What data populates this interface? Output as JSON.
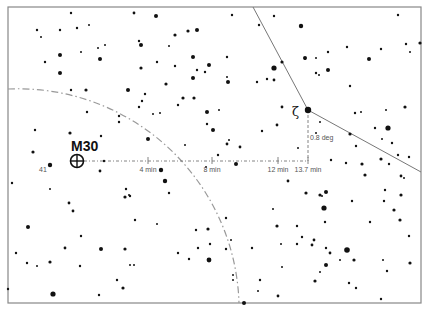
{
  "chart": {
    "frame": {
      "x": 8,
      "y": 7,
      "w": 413,
      "h": 296,
      "color": "#888888"
    },
    "target": {
      "label": "M30",
      "x": 77,
      "y": 161,
      "r": 6.5,
      "label_x": 71,
      "label_y": 151
    },
    "guide_star": {
      "label": "ζ",
      "x": 308,
      "y": 110,
      "glyph_x": 292,
      "glyph_y": 116
    },
    "star_label_41": {
      "label": "41",
      "x": 39,
      "y": 172
    },
    "horizontal_line": {
      "x1": 84,
      "x2": 308,
      "y": 161
    },
    "vertical_line": {
      "x": 308,
      "y1": 115,
      "y2": 161
    },
    "ticks": [
      {
        "x": 148,
        "label": "4 min"
      },
      {
        "x": 212,
        "label": "8 min"
      },
      {
        "x": 278,
        "label": "12 min"
      },
      {
        "x": 308,
        "label": "13.7 min"
      }
    ],
    "vertical_label": "0.8 deg",
    "boundary_line": [
      [
        253,
        7
      ],
      [
        308,
        110
      ],
      [
        421,
        172
      ]
    ],
    "dashed_arc": {
      "cx": 20,
      "cy": 310,
      "r": 221,
      "start": [
        8,
        89
      ],
      "end": [
        239,
        303
      ]
    },
    "stars": [
      [
        71,
        13,
        1.2
      ],
      [
        134,
        13,
        1.4
      ],
      [
        156,
        16,
        2
      ],
      [
        232,
        15,
        1.2
      ],
      [
        37,
        30,
        1.2
      ],
      [
        60,
        30,
        1.2
      ],
      [
        77,
        28,
        1.2
      ],
      [
        89,
        25,
        1
      ],
      [
        41,
        37,
        1
      ],
      [
        175,
        35,
        1.6
      ],
      [
        188,
        31,
        1.6
      ],
      [
        197,
        30,
        2
      ],
      [
        139,
        41,
        1.2
      ],
      [
        141,
        45,
        2
      ],
      [
        169,
        46,
        1
      ],
      [
        105,
        45,
        1
      ],
      [
        98,
        48,
        1
      ],
      [
        81,
        52,
        1
      ],
      [
        60,
        55,
        2
      ],
      [
        45,
        62,
        1.2
      ],
      [
        100,
        59,
        2
      ],
      [
        193,
        57,
        2
      ],
      [
        157,
        62,
        1.2
      ],
      [
        141,
        68,
        1.6
      ],
      [
        175,
        66,
        1.2
      ],
      [
        209,
        65,
        2
      ],
      [
        197,
        70,
        1.2
      ],
      [
        205,
        72,
        1.2
      ],
      [
        60,
        73,
        2
      ],
      [
        193,
        78,
        2
      ],
      [
        227,
        57,
        1.2
      ],
      [
        227,
        77,
        1
      ],
      [
        228,
        82,
        2
      ],
      [
        166,
        84,
        1.6
      ],
      [
        71,
        90,
        1.2
      ],
      [
        86,
        90,
        1.6
      ],
      [
        128,
        90,
        2
      ],
      [
        145,
        94,
        1.2
      ],
      [
        142,
        101,
        1.2
      ],
      [
        139,
        107,
        1.2
      ],
      [
        183,
        98,
        1.6
      ],
      [
        194,
        98,
        1.6
      ],
      [
        178,
        105,
        1.2
      ],
      [
        207,
        112,
        2
      ],
      [
        153,
        114,
        1
      ],
      [
        160,
        113,
        1
      ],
      [
        87,
        112,
        1.2
      ],
      [
        119,
        116,
        1.2
      ],
      [
        119,
        122,
        1.2
      ],
      [
        207,
        124,
        1.2
      ],
      [
        213,
        130,
        2
      ],
      [
        219,
        110,
        1
      ],
      [
        148,
        139,
        2
      ],
      [
        227,
        144,
        1.4
      ],
      [
        229,
        140,
        1
      ],
      [
        240,
        147,
        1.4
      ],
      [
        185,
        145,
        1
      ],
      [
        35,
        130,
        1.2
      ],
      [
        70,
        133,
        1.6
      ],
      [
        101,
        136,
        1.2
      ],
      [
        33,
        152,
        1.6
      ],
      [
        50,
        165,
        2.2
      ],
      [
        218,
        155,
        1.2
      ],
      [
        236,
        164,
        2
      ],
      [
        206,
        167,
        1
      ],
      [
        161,
        170,
        2.2
      ],
      [
        100,
        171,
        1.4
      ],
      [
        104,
        161,
        1.2
      ],
      [
        274,
        16,
        1.2
      ],
      [
        301,
        26,
        2.2
      ],
      [
        259,
        25,
        1.2
      ],
      [
        282,
        62,
        1.6
      ],
      [
        274,
        68,
        2.6
      ],
      [
        267,
        79,
        1.2
      ],
      [
        274,
        80,
        1.4
      ],
      [
        257,
        82,
        1.2
      ],
      [
        305,
        58,
        2
      ],
      [
        305,
        59,
        1
      ],
      [
        328,
        52,
        1.2
      ],
      [
        347,
        47,
        1.2
      ],
      [
        316,
        58,
        1
      ],
      [
        328,
        70,
        2
      ],
      [
        316,
        73,
        1.2
      ],
      [
        319,
        75,
        1
      ],
      [
        350,
        86,
        1.2
      ],
      [
        369,
        59,
        2
      ],
      [
        398,
        15,
        1.2
      ],
      [
        406,
        44,
        1.2
      ],
      [
        410,
        52,
        1
      ],
      [
        420,
        43,
        1.6
      ],
      [
        381,
        49,
        1.2
      ],
      [
        405,
        107,
        1.6
      ],
      [
        388,
        128,
        2.6
      ],
      [
        355,
        113,
        1.2
      ],
      [
        361,
        112,
        1
      ],
      [
        375,
        128,
        1.2
      ],
      [
        386,
        110,
        1
      ],
      [
        282,
        107,
        1.4
      ],
      [
        277,
        125,
        1.4
      ],
      [
        320,
        122,
        1
      ],
      [
        262,
        131,
        1.2
      ],
      [
        350,
        134,
        1.6
      ],
      [
        316,
        133,
        1
      ],
      [
        298,
        148,
        1
      ],
      [
        392,
        143,
        1.2
      ],
      [
        382,
        139,
        1
      ],
      [
        320,
        195,
        1.6
      ],
      [
        322,
        196,
        1
      ],
      [
        331,
        160,
        1.2
      ],
      [
        346,
        163,
        1.2
      ],
      [
        356,
        146,
        1.2
      ],
      [
        362,
        164,
        1.6
      ],
      [
        365,
        175,
        1.6
      ],
      [
        381,
        159,
        1.6
      ],
      [
        389,
        164,
        1.2
      ],
      [
        398,
        155,
        1.2
      ],
      [
        409,
        157,
        1.2
      ],
      [
        401,
        176,
        1.4
      ],
      [
        404,
        178,
        1
      ],
      [
        394,
        210,
        1.6
      ],
      [
        385,
        190,
        1.2
      ],
      [
        384,
        201,
        1.2
      ],
      [
        288,
        181,
        1.4
      ],
      [
        306,
        193,
        1.6
      ],
      [
        352,
        201,
        1.2
      ],
      [
        273,
        209,
        1
      ],
      [
        277,
        226,
        1.6
      ],
      [
        297,
        226,
        1.2
      ],
      [
        326,
        192,
        2
      ],
      [
        324,
        208,
        2.6
      ],
      [
        325,
        222,
        1.2
      ],
      [
        370,
        222,
        1.2
      ],
      [
        401,
        195,
        1.6
      ],
      [
        394,
        210,
        1
      ],
      [
        312,
        245,
        1.4
      ],
      [
        326,
        248,
        1.2
      ],
      [
        326,
        265,
        2
      ],
      [
        354,
        260,
        1.6
      ],
      [
        320,
        272,
        1
      ],
      [
        347,
        250,
        2.8
      ],
      [
        330,
        253,
        1.4
      ],
      [
        340,
        260,
        1
      ],
      [
        302,
        237,
        1.2
      ],
      [
        314,
        240,
        1.4
      ],
      [
        356,
        288,
        1.2
      ],
      [
        381,
        299,
        1.2
      ],
      [
        258,
        291,
        1
      ],
      [
        260,
        280,
        1.2
      ],
      [
        278,
        296,
        1.4
      ],
      [
        349,
        283,
        1.2
      ],
      [
        315,
        281,
        1.6
      ],
      [
        297,
        244,
        1.2
      ],
      [
        409,
        236,
        1.2
      ],
      [
        400,
        220,
        1.6
      ],
      [
        410,
        263,
        1.6
      ],
      [
        281,
        244,
        1
      ],
      [
        282,
        267,
        1
      ],
      [
        387,
        271,
        1.2
      ],
      [
        383,
        260,
        1
      ],
      [
        244,
        303,
        2
      ],
      [
        233,
        280,
        1
      ],
      [
        252,
        248,
        1.2
      ],
      [
        233,
        275,
        1
      ],
      [
        12,
        183,
        1.2
      ],
      [
        50,
        189,
        1
      ],
      [
        69,
        203,
        1.4
      ],
      [
        73,
        211,
        1.4
      ],
      [
        28,
        227,
        2
      ],
      [
        16,
        253,
        1.2
      ],
      [
        27,
        263,
        1.2
      ],
      [
        37,
        266,
        1
      ],
      [
        50,
        262,
        1.6
      ],
      [
        65,
        248,
        1.4
      ],
      [
        81,
        236,
        1.2
      ],
      [
        80,
        266,
        1.2
      ],
      [
        101,
        249,
        2
      ],
      [
        125,
        249,
        1.6
      ],
      [
        130,
        196,
        1.2
      ],
      [
        125,
        197,
        1.6
      ],
      [
        126,
        189,
        1.2
      ],
      [
        129,
        195,
        1
      ],
      [
        135,
        220,
        1.2
      ],
      [
        157,
        224,
        1
      ],
      [
        165,
        181,
        2.2
      ],
      [
        169,
        193,
        1.2
      ],
      [
        8,
        289,
        1.2
      ],
      [
        53,
        294,
        2.6
      ],
      [
        99,
        295,
        1.2
      ],
      [
        123,
        288,
        1.6
      ],
      [
        117,
        280,
        1.2
      ],
      [
        130,
        265,
        1
      ],
      [
        134,
        265,
        1
      ],
      [
        178,
        253,
        1.2
      ],
      [
        189,
        259,
        1.2
      ],
      [
        196,
        230,
        1.2
      ],
      [
        208,
        229,
        1.6
      ],
      [
        198,
        248,
        1.2
      ],
      [
        209,
        260,
        2.4
      ],
      [
        226,
        249,
        1.2
      ],
      [
        231,
        240,
        1
      ],
      [
        210,
        244,
        1.2
      ],
      [
        226,
        218,
        1.2
      ]
    ]
  }
}
